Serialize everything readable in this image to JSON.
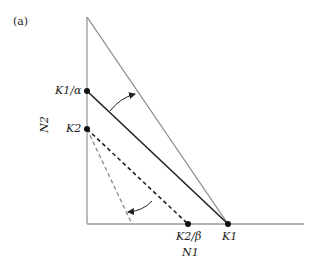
{
  "panel_label": "(a)",
  "axes": {
    "x_label": "N1",
    "y_label": "N2"
  },
  "points": {
    "k1_alpha": "K1/α",
    "k2": "K2",
    "k2_beta": "K2/β",
    "k1": "K1"
  },
  "colors": {
    "axis": "#999999",
    "solid": "#222222",
    "gray_line": "#8a8a8a",
    "dashed_dark": "#222222",
    "dashed_gray": "#888888"
  }
}
